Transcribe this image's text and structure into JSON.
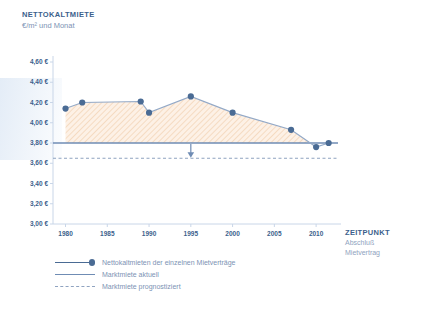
{
  "header": {
    "title": "NETTOKALTMIETE",
    "subtitle": "€/m² und Monat"
  },
  "xaxis_title": {
    "title": "ZEITPUNKT",
    "line1": "Abschluß",
    "line2": "Mietvertrag"
  },
  "legend": [
    {
      "label": "Nettokaltmieten der einzelnen Mietverträge",
      "key": "line-with-dot",
      "color": "#4a6b94"
    },
    {
      "label": "Marktmiete aktuell",
      "key": "solid-line",
      "color": "#6f8cb4"
    },
    {
      "label": "Marktmiete prognostiziert",
      "key": "dashed-line",
      "color": "#8fa3c0"
    }
  ],
  "chart_data": {
    "type": "line",
    "title": "NETTOKALTMIETE",
    "subtitle": "€/m² und Monat",
    "xlabel": "ZEITPUNKT Abschluß Mietvertrag",
    "ylabel": "€/m² und Monat",
    "xlim": [
      1978.5,
      2012.5
    ],
    "ylim": [
      3.0,
      4.6
    ],
    "ytick_labels": [
      "4,60 €",
      "4,40 €",
      "4,20 €",
      "4,00 €",
      "3,80 €",
      "3,60 €",
      "3,40 €",
      "3,20 €",
      "3,00 €"
    ],
    "ytick_values": [
      4.6,
      4.4,
      4.2,
      4.0,
      3.8,
      3.6,
      3.4,
      3.2,
      3.0
    ],
    "xtick_labels": [
      "1980",
      "1985",
      "1990",
      "1995",
      "2000",
      "2005",
      "2010"
    ],
    "xtick_values": [
      1980,
      1985,
      1990,
      1995,
      2000,
      2005,
      2010
    ],
    "grid": false,
    "legend_position": "below",
    "fill": "hatched-orange",
    "series": [
      {
        "name": "Nettokaltmieten der einzelnen Mietverträge",
        "type": "line-markers-area",
        "color": "#4a6b94",
        "x": [
          1980,
          1982,
          1989,
          1990,
          1995,
          2000,
          2007,
          2010,
          2011.5
        ],
        "values": [
          4.14,
          4.2,
          4.21,
          4.1,
          4.26,
          4.1,
          3.93,
          3.76,
          3.8
        ]
      },
      {
        "name": "Marktmiete aktuell",
        "type": "hline",
        "color": "#6f8cb4",
        "value": 3.8
      },
      {
        "name": "Marktmiete prognostiziert",
        "type": "hline-dashed",
        "color": "#8fa3c0",
        "value": 3.65
      }
    ],
    "annotations": [
      {
        "type": "arrow-down",
        "x": 1995,
        "from": 3.8,
        "to": 3.65
      }
    ]
  }
}
